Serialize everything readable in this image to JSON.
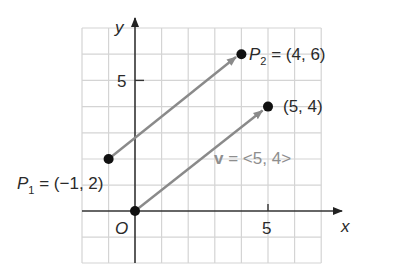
{
  "diagram": {
    "type": "coordinate-plane-vectors",
    "axes": {
      "x_label": "x",
      "y_label": "y",
      "origin_label": "O",
      "x_tick_label": "5",
      "y_tick_label": "5",
      "x_range": [
        -2,
        7
      ],
      "y_range": [
        -2,
        7
      ],
      "grid_step": 1
    },
    "points": [
      {
        "name": "P1",
        "x": -1,
        "y": 2,
        "label_main": "P",
        "label_sub": "1",
        "label_rest": " = (−1, 2)"
      },
      {
        "name": "P2",
        "x": 4,
        "y": 6,
        "label_main": "P",
        "label_sub": "2",
        "label_rest": " = (4, 6)"
      },
      {
        "name": "origin",
        "x": 0,
        "y": 0
      },
      {
        "name": "head",
        "x": 5,
        "y": 4,
        "label": "(5, 4)"
      }
    ],
    "vectors": [
      {
        "from": [
          -1,
          2
        ],
        "to": [
          4,
          6
        ],
        "label": ""
      },
      {
        "from": [
          0,
          0
        ],
        "to": [
          5,
          4
        ],
        "label_bold": "v",
        "label_rest": " = <5, 4>"
      }
    ],
    "colors": {
      "grid": "#d4d4d4",
      "axis": "#333333",
      "vector": "#8a8a8a",
      "point": "#111111",
      "vector_label": "#8e8e8e",
      "text": "#2a2a2a"
    }
  }
}
